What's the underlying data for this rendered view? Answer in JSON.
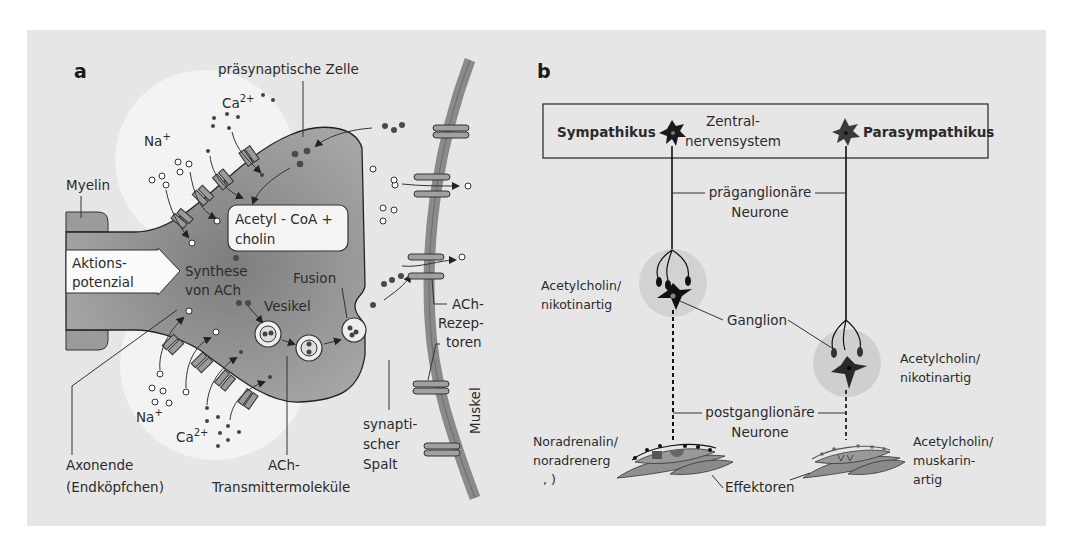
{
  "figure": {
    "background_color": "#e6e6e6",
    "panels": [
      {
        "id": "a",
        "letter": "a",
        "title": "Synapse / neuromuskuläre Endplatte",
        "labels": {
          "presynaptic_cell": "präsynaptische Zelle",
          "ca_top": "Ca",
          "ca_top_sup": "2+",
          "na_top": "Na",
          "na_top_sup": "+",
          "myelin": "Myelin",
          "acetyl_line1": "Acetyl - CoA +",
          "acetyl_line2": "cholin",
          "action_line1": "Aktions-",
          "action_line2": "potenzial",
          "synthese_line1": "Synthese",
          "synthese_line2": "von ACh",
          "vesikel": "Vesikel",
          "fusion": "Fusion",
          "ach_rec_line1": "ACh-",
          "ach_rec_line2": "Rezep-",
          "ach_rec_line3": "toren",
          "na_bottom": "Na",
          "na_bottom_sup": "+",
          "ca_bottom": "Ca",
          "ca_bottom_sup": "2+",
          "axon_line1": "Axonende",
          "axon_line2": "(Endköpfchen)",
          "transmitter_line1": "ACh-",
          "transmitter_line2": "Transmittermoleküle",
          "spalt_line1": "synapti-",
          "spalt_line2": "scher",
          "spalt_line3": "Spalt",
          "muskel": "Muskel"
        },
        "colors": {
          "cell_dark": "#8c8c8c",
          "cell_mid": "#a8a8a8",
          "halo": "#f2f2f2",
          "muscle": "#8a8a8a",
          "ion_dark": "#4a4a4a"
        }
      },
      {
        "id": "b",
        "letter": "b",
        "title": "Vegetatives Nervensystem",
        "labels": {
          "sympathikus": "Sympathikus",
          "zns_line1": "Zentral-",
          "zns_line2": "nervensystem",
          "parasympathikus": "Parasympathikus",
          "pre_line1": "präganglionäre",
          "pre_line2": "Neurone",
          "left_ach_line1": "Acetylcholin/",
          "left_ach_line2": "nikotinartig",
          "ganglion": "Ganglion",
          "right_ach_line1": "Acetylcholin/",
          "right_ach_line2": "nikotinartig",
          "post_line1": "postganglionäre",
          "post_line2": "Neurone",
          "nor_line1": "Noradrenalin/",
          "nor_line2": "noradrenerg",
          "nor_line3": ",   )",
          "effektoren": "Effektoren",
          "musk_line1": "Acetylcholin/",
          "musk_line2": "muskarin-",
          "musk_line3": "artig"
        },
        "colors": {
          "neuron": "#1a1a1a",
          "ganglion_halo": "#d2d2d2",
          "effector": "#8f8f8f"
        }
      }
    ]
  }
}
